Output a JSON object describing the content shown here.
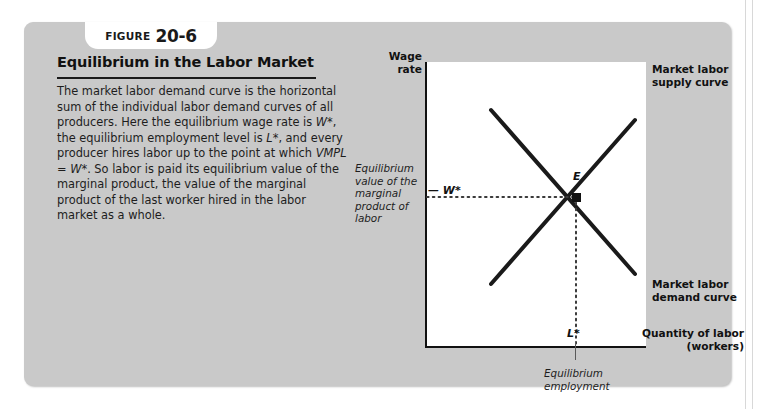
{
  "figure": {
    "tab_word": "Figure",
    "tab_number": "20-6",
    "title": "Equilibrium in the Labor Market",
    "body_text": "The market labor demand curve is the horizontal sum of the individual labor demand curves of all producers. Here the equilibrium wage rate is W*, the equilibrium employment level is L*, and every producer hires labor up to the point at which VMPL = W*. So labor is paid its equilibrium value of the marginal product, the value of the marginal product of the last worker hired in the labor market as a whole."
  },
  "chart_data": {
    "type": "line",
    "title": "Equilibrium in the Labor Market",
    "xlabel": "Quantity of labor (workers)",
    "ylabel": "Wage rate",
    "grid": false,
    "legend": "inline-annotations",
    "xlim": [
      0,
      100
    ],
    "ylim": [
      0,
      100
    ],
    "series": [
      {
        "name": "Market labor supply curve",
        "slope": "upward",
        "points": [
          [
            30,
            8
          ],
          [
            95,
            82
          ]
        ]
      },
      {
        "name": "Market labor demand curve",
        "slope": "downward",
        "points": [
          [
            30,
            92
          ],
          [
            95,
            18
          ]
        ]
      }
    ],
    "annotations": [
      {
        "name": "equilibrium-point",
        "label": "E",
        "x": 68,
        "y": 53
      },
      {
        "name": "equilibrium-wage",
        "label": "W*",
        "axis": "y",
        "y": 53
      },
      {
        "name": "equilibrium-quantity",
        "label": "L*",
        "axis": "x",
        "x": 68
      }
    ],
    "dotted_guides": [
      {
        "name": "wage-guide",
        "orientation": "horizontal",
        "from": [
          0,
          53
        ],
        "to": [
          68,
          53
        ]
      },
      {
        "name": "quantity-guide",
        "orientation": "vertical",
        "from": [
          68,
          53
        ],
        "to": [
          68,
          0
        ]
      }
    ]
  },
  "labels": {
    "wage_rate": "Wage\nrate",
    "quantity_of_labor": "Quantity of labor\n(workers)",
    "supply_curve": "Market labor\nsupply curve",
    "demand_curve": "Market labor\ndemand curve",
    "equilibrium_point": "E",
    "wage_star": "— W*",
    "labor_star": "L*"
  },
  "annotations": {
    "vmp_callout": "Equilibrium\nvalue of the\nmarginal\nproduct of\nlabor",
    "equilibrium_employment": "Equilibrium\nemployment"
  },
  "colors": {
    "panel_background": "#c9c9c9",
    "plot_background": "#ffffff",
    "curve": "#1a1a1a",
    "axis": "#111111",
    "text": "#1d1d1d",
    "dotted_guide": "#4a4a4a"
  }
}
